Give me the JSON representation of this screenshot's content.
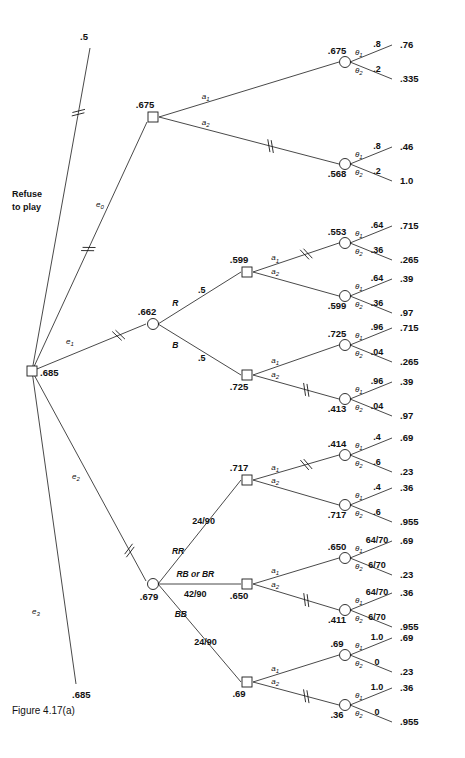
{
  "figure": {
    "caption": "Figure 4.17(a)",
    "refuse_label_line1": "Refuse",
    "refuse_label_line2": "to play",
    "root_value": ".685"
  },
  "chart_data": {
    "type": "diagram",
    "title": "Figure 4.17(a)",
    "diagram_kind": "decision-tree",
    "root": {
      "type": "decision",
      "value": ".685",
      "branches": [
        {
          "label": "Refuse to play",
          "pruned": true,
          "terminal_value": ".5"
        },
        {
          "label": "e0",
          "pruned": true,
          "child_value": ".675"
        },
        {
          "label": "e1",
          "pruned": true,
          "child_value": ".662"
        },
        {
          "label": "e2",
          "pruned": false,
          "child_value": ".679"
        },
        {
          "label": "e3",
          "pruned": false,
          "terminal_value": ".685"
        }
      ]
    },
    "subtrees": [
      {
        "experiment": "e0",
        "node": {
          "type": "decision",
          "value": ".675"
        },
        "actions": [
          {
            "action": "a1",
            "pruned": false,
            "chance_value": ".675",
            "outcomes": [
              {
                "state": "theta1",
                "prob": ".8",
                "payoff": ".76"
              },
              {
                "state": "theta2",
                "prob": ".2",
                "payoff": ".335"
              }
            ]
          },
          {
            "action": "a2",
            "pruned": true,
            "chance_value": ".568",
            "outcomes": [
              {
                "state": "theta1",
                "prob": ".8",
                "payoff": ".46"
              },
              {
                "state": "theta2",
                "prob": ".2",
                "payoff": "1.0"
              }
            ]
          }
        ]
      },
      {
        "experiment": "e1",
        "node": {
          "type": "chance",
          "value": ".662"
        },
        "results": [
          {
            "result": "R",
            "prob": ".5",
            "decision_value": ".599",
            "actions": [
              {
                "action": "a1",
                "pruned": true,
                "chance_value": ".553",
                "outcomes": [
                  {
                    "state": "theta1",
                    "prob": ".64",
                    "payoff": ".715"
                  },
                  {
                    "state": "theta2",
                    "prob": ".36",
                    "payoff": ".265"
                  }
                ]
              },
              {
                "action": "a2",
                "pruned": false,
                "chance_value": ".599",
                "outcomes": [
                  {
                    "state": "theta1",
                    "prob": ".64",
                    "payoff": ".39"
                  },
                  {
                    "state": "theta2",
                    "prob": ".36",
                    "payoff": ".97"
                  }
                ]
              }
            ]
          },
          {
            "result": "B",
            "prob": ".5",
            "decision_value": ".725",
            "actions": [
              {
                "action": "a1",
                "pruned": false,
                "chance_value": ".725",
                "outcomes": [
                  {
                    "state": "theta1",
                    "prob": ".96",
                    "payoff": ".715"
                  },
                  {
                    "state": "theta2",
                    "prob": ".04",
                    "payoff": ".265"
                  }
                ]
              },
              {
                "action": "a2",
                "pruned": true,
                "chance_value": ".413",
                "outcomes": [
                  {
                    "state": "theta1",
                    "prob": ".96",
                    "payoff": ".39"
                  },
                  {
                    "state": "theta2",
                    "prob": ".04",
                    "payoff": ".97"
                  }
                ]
              }
            ]
          }
        ]
      },
      {
        "experiment": "e2",
        "node": {
          "type": "chance",
          "value": ".679"
        },
        "results": [
          {
            "result": "RR",
            "prob": "24/90",
            "decision_value": ".717",
            "actions": [
              {
                "action": "a1",
                "pruned": true,
                "chance_value": ".414",
                "outcomes": [
                  {
                    "state": "theta1",
                    "prob": ".4",
                    "payoff": ".69"
                  },
                  {
                    "state": "theta2",
                    "prob": ".6",
                    "payoff": ".23"
                  }
                ]
              },
              {
                "action": "a2",
                "pruned": false,
                "chance_value": ".717",
                "outcomes": [
                  {
                    "state": "theta1",
                    "prob": ".4",
                    "payoff": ".36"
                  },
                  {
                    "state": "theta2",
                    "prob": ".6",
                    "payoff": ".955"
                  }
                ]
              }
            ]
          },
          {
            "result": "RB or BR",
            "prob": "42/90",
            "decision_value": ".650",
            "actions": [
              {
                "action": "a1",
                "pruned": false,
                "chance_value": ".650",
                "outcomes": [
                  {
                    "state": "theta1",
                    "prob": "64/70",
                    "payoff": ".69"
                  },
                  {
                    "state": "theta2",
                    "prob": "6/70",
                    "payoff": ".23"
                  }
                ]
              },
              {
                "action": "a2",
                "pruned": true,
                "chance_value": ".411",
                "outcomes": [
                  {
                    "state": "theta1",
                    "prob": "64/70",
                    "payoff": ".36"
                  },
                  {
                    "state": "theta2",
                    "prob": "6/70",
                    "payoff": ".955"
                  }
                ]
              }
            ]
          },
          {
            "result": "BB",
            "prob": "24/90",
            "decision_value": ".69",
            "actions": [
              {
                "action": "a1",
                "pruned": false,
                "chance_value": ".69",
                "outcomes": [
                  {
                    "state": "theta1",
                    "prob": "1.0",
                    "payoff": ".69"
                  },
                  {
                    "state": "theta2",
                    "prob": "0",
                    "payoff": ".23"
                  }
                ]
              },
              {
                "action": "a2",
                "pruned": true,
                "chance_value": ".36",
                "outcomes": [
                  {
                    "state": "theta1",
                    "prob": "1.0",
                    "payoff": ".36"
                  },
                  {
                    "state": "theta2",
                    "prob": "0",
                    "payoff": ".955"
                  }
                ]
              }
            ]
          }
        ]
      }
    ]
  },
  "labels": {
    "theta1": "θ",
    "theta2": "θ",
    "a": "a",
    "e": "e",
    "sub1": "1",
    "sub2": "2",
    "sub0": "0",
    "sub3": "3"
  },
  "colors": {
    "ink": "#111111",
    "background": "#ffffff"
  }
}
